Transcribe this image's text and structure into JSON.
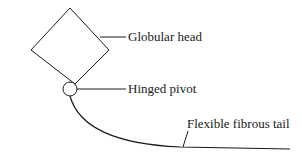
{
  "diagram": {
    "labels": {
      "head": "Globular head",
      "pivot": "Hinged pivot",
      "tail": "Flexible fibrous tail"
    },
    "colors": {
      "stroke": "#1a1a1a",
      "background": "#ffffff"
    }
  }
}
